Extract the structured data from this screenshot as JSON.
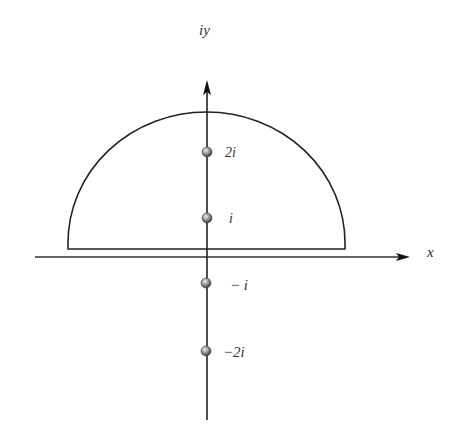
{
  "diagram": {
    "type": "complex-plane-contour",
    "axes": {
      "vertical_label": "iy",
      "horizontal_label": "x"
    },
    "contour": {
      "shape": "upper-semicircle",
      "description": "Closed semicircular contour in upper half-plane"
    },
    "points": [
      {
        "label": "2i",
        "value": "2i",
        "inside_contour": true
      },
      {
        "label": "i",
        "value": "i",
        "inside_contour": true
      },
      {
        "label": "− i",
        "value": "-i",
        "inside_contour": false
      },
      {
        "label": "−2i",
        "value": "-2i",
        "inside_contour": false
      }
    ],
    "colors": {
      "line": "#222222",
      "point": "#888888",
      "text": "#333333"
    }
  }
}
